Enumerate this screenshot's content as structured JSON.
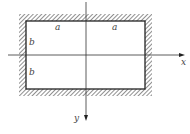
{
  "diagram": {
    "type": "clamped-rectangular-plate",
    "colors": {
      "line": "#222222",
      "hatch": "#333333",
      "background": "#ffffff"
    },
    "axes": {
      "x": {
        "label": "x",
        "direction": "right"
      },
      "y": {
        "label": "y",
        "direction": "down"
      }
    },
    "dimensions": {
      "top_left_half": "a",
      "top_right_half": "a",
      "left_upper_half": "b",
      "left_lower_half": "b"
    },
    "boundary": "all edges clamped (hatched)"
  }
}
